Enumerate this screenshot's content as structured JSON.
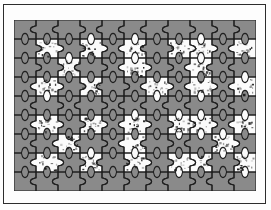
{
  "figure": {
    "type": "jigsaw-puzzle-binary-image",
    "title": "",
    "caption": "",
    "frame": {
      "canvas_width": 271,
      "canvas_height": 210,
      "background_color": "#ffffff",
      "border_color": "#2c2c2c",
      "border_width_px": 1.4
    },
    "puzzle": {
      "x": 14,
      "y": 20,
      "width": 242,
      "height": 171,
      "columns": 11,
      "rows": 9,
      "background_color": "#8a8a8a",
      "piece_outline_color": "#1f1f1f",
      "piece_outline_width_px": 1.1,
      "tab_style": "classic-knob",
      "tab_radius_px": 3.2,
      "fill_color_on": "#fbfbfb",
      "fill_color_off": "#8a8a8a",
      "speckle_color": "#141414",
      "speckle_density": 0.1
    }
  },
  "chart_data": {
    "type": "heatmap",
    "title": "",
    "xlabel": "",
    "ylabel": "",
    "columns": 11,
    "rows": 9,
    "value_labels": {
      "0": "gray-piece",
      "1": "white-piece"
    },
    "grid": [
      [
        0,
        0,
        0,
        0,
        0,
        0,
        0,
        0,
        0,
        0,
        0
      ],
      [
        0,
        1,
        0,
        1,
        0,
        1,
        0,
        1,
        1,
        0,
        1
      ],
      [
        0,
        0,
        1,
        0,
        0,
        1,
        0,
        0,
        1,
        0,
        0
      ],
      [
        0,
        1,
        0,
        1,
        0,
        0,
        1,
        0,
        1,
        0,
        1
      ],
      [
        0,
        0,
        0,
        0,
        0,
        0,
        0,
        0,
        0,
        0,
        0
      ],
      [
        0,
        1,
        0,
        1,
        0,
        1,
        0,
        1,
        1,
        0,
        1
      ],
      [
        0,
        0,
        1,
        0,
        0,
        1,
        0,
        0,
        0,
        1,
        0
      ],
      [
        0,
        1,
        0,
        1,
        0,
        1,
        0,
        1,
        1,
        0,
        1
      ],
      [
        0,
        0,
        0,
        0,
        0,
        0,
        0,
        0,
        0,
        0,
        0
      ]
    ],
    "legend": [],
    "grid_on": true
  }
}
